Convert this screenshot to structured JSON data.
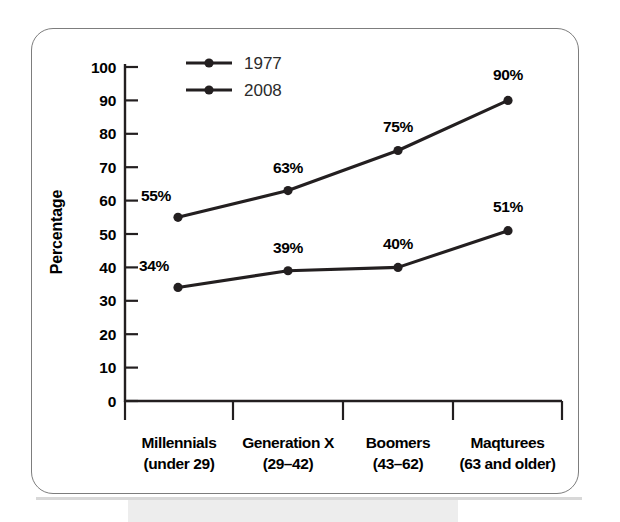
{
  "chart_data": {
    "type": "line",
    "title": "",
    "xlabel": "",
    "ylabel": "Percentage",
    "ylim": [
      0,
      100
    ],
    "ytick_step": 10,
    "grid": false,
    "legend_position": "top-left-inside",
    "categories": [
      "Millennials",
      "Generation X",
      "Boomers",
      "Maqturees"
    ],
    "category_sublabels": [
      "(under 29)",
      "(29–42)",
      "(43–62)",
      "(63 and older)"
    ],
    "ytick_labels": [
      "0",
      "10",
      "20",
      "30",
      "40",
      "50",
      "60",
      "70",
      "80",
      "90",
      "100"
    ],
    "series": [
      {
        "name": "1977",
        "values": [
          55,
          63,
          75,
          90
        ],
        "point_labels": [
          "55%",
          "63%",
          "75%",
          "90%"
        ],
        "color": "#231f20",
        "marker": "circle"
      },
      {
        "name": "2008",
        "values": [
          34,
          39,
          40,
          51
        ],
        "point_labels": [
          "34%",
          "39%",
          "40%",
          "51%"
        ],
        "color": "#231f20",
        "marker": "circle"
      }
    ]
  },
  "colors": {
    "line": "#231f20",
    "axis": "#231f20",
    "frame": "#7d7d7d",
    "text": "#000000",
    "legend_text": "#2b2b2b",
    "page_background": "#ffffff",
    "scan_band": "#ededed"
  }
}
